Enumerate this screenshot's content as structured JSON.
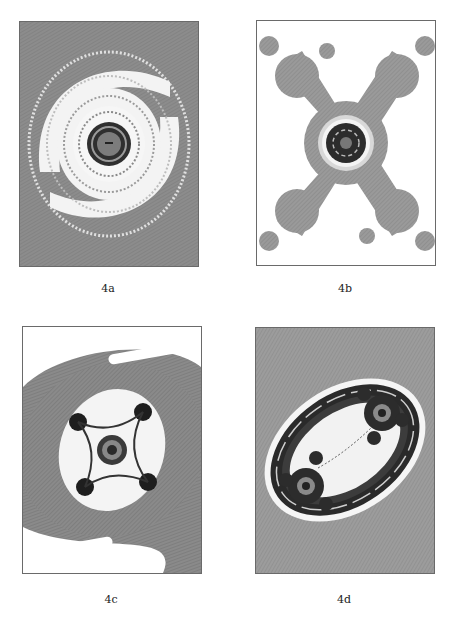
{
  "figure": {
    "panels": [
      {
        "id": "4a",
        "label": "4a",
        "description": "Spiral fractal with gray bands, white arms and dark center"
      },
      {
        "id": "4b",
        "label": "4b",
        "description": "X-shaped fractal with central dark spiral on white background"
      },
      {
        "id": "4c",
        "label": "4c",
        "description": "Four-armed fractal with dark spirals inside gray rings"
      },
      {
        "id": "4d",
        "label": "4d",
        "description": "Two-lobed fractal inside dark elliptical rings on gray background"
      }
    ],
    "colors": {
      "background": "#ffffff",
      "gray_band": "#8a8a8a",
      "dark": "#2a2a2a",
      "light": "#f2f2f2",
      "border": "#6a6a6a"
    }
  }
}
